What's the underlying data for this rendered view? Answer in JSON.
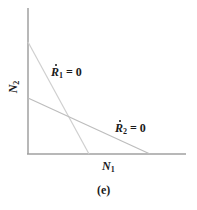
{
  "figure": {
    "caption": "(e)",
    "axes": {
      "x_label_var": "N",
      "x_label_sub": "1",
      "y_label_var": "N",
      "y_label_sub": "2"
    },
    "isoclines": [
      {
        "var": "R",
        "sub": "1",
        "rhs": " = 0",
        "color": "#c8c8c8",
        "start": [
          28,
          42
        ],
        "end": [
          89,
          154
        ]
      },
      {
        "var": "R",
        "sub": "2",
        "rhs": " = 0",
        "color": "#b8b8b8",
        "start": [
          28,
          98
        ],
        "end": [
          150,
          154
        ]
      }
    ],
    "colors": {
      "axis": "#a0a0a0",
      "text": "#1a1a1a"
    }
  }
}
